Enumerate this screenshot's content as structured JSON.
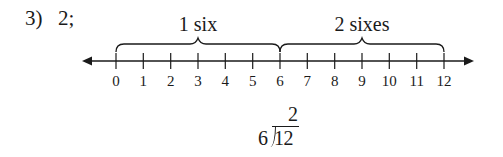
{
  "problem": {
    "number_label": "3)",
    "answer_label": "2;"
  },
  "number_line": {
    "min": 0,
    "max": 12,
    "step": 1,
    "tick_labels": [
      "0",
      "1",
      "2",
      "3",
      "4",
      "5",
      "6",
      "7",
      "8",
      "9",
      "10",
      "11",
      "12"
    ],
    "arrows": "both",
    "color": "#1a1a1a"
  },
  "braces": [
    {
      "label": "1 six",
      "from": 0,
      "to": 6
    },
    {
      "label": "2 sixes",
      "from": 6,
      "to": 12
    }
  ],
  "long_division": {
    "quotient": "2",
    "divisor": "6",
    "dividend": "12"
  }
}
